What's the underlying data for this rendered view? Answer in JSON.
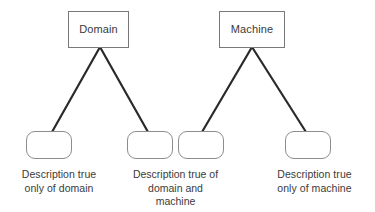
{
  "diagram": {
    "type": "venn-style-tree-diagram",
    "background_color": "#ffffff",
    "line_color": "#2a2a2a",
    "rect_border_color": "#787878",
    "round_border_color": "#8d8d8d",
    "text_color": "#3a3a3a",
    "top_nodes": [
      {
        "id": "domain",
        "label": "Domain"
      },
      {
        "id": "machine",
        "label": "Machine"
      }
    ],
    "bottom_nodes": [
      {
        "id": "box-1",
        "label": ""
      },
      {
        "id": "box-2",
        "label": ""
      },
      {
        "id": "box-3",
        "label": ""
      },
      {
        "id": "box-4",
        "label": ""
      }
    ],
    "captions": [
      {
        "id": "caption-domain-only",
        "line1": "Description true",
        "line2": "only of domain",
        "line3": ""
      },
      {
        "id": "caption-domain-and-machine",
        "line1": "Description true of",
        "line2": "domain and",
        "line3": "machine"
      },
      {
        "id": "caption-machine-only",
        "line1": "Description true",
        "line2": "only of machine",
        "line3": ""
      }
    ],
    "edges": [
      {
        "id": "edge-domain-to-box-1",
        "from": "domain",
        "to": "box-1"
      },
      {
        "id": "edge-domain-to-box-2",
        "from": "domain",
        "to": "box-2"
      },
      {
        "id": "edge-machine-to-box-3",
        "from": "machine",
        "to": "box-3"
      },
      {
        "id": "edge-machine-to-box-4",
        "from": "machine",
        "to": "box-4"
      }
    ]
  }
}
